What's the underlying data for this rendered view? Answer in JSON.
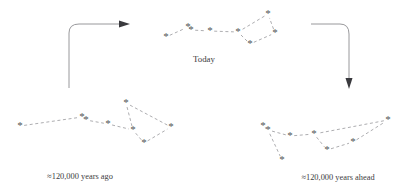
{
  "figure": {
    "background_color": "#ffffff",
    "star_color": "#555558",
    "link_color": "#8a8a8e",
    "arrow_color": "#8c8c90",
    "arrowhead_color": "#3a3a3e",
    "text_color": "#3c3c40",
    "star_glyph": "*"
  },
  "captions": {
    "past": "≈120,000 years ago",
    "present": "Today",
    "future": "≈120,000 years ahead"
  },
  "caption_positions": {
    "past": {
      "x": 80,
      "y": 179
    },
    "present": {
      "x": 204,
      "y": 62
    },
    "future": {
      "x": 338,
      "y": 180
    }
  },
  "chart_data": {
    "type": "scatter",
    "xlabel": "",
    "ylabel": "",
    "grid": false,
    "legend": null,
    "panels": [
      {
        "name": "present",
        "label": "Today",
        "stars": [
          {
            "name": "Alkaid",
            "x": 166,
            "y": 37
          },
          {
            "name": "Mizar",
            "x": 188,
            "y": 27
          },
          {
            "name": "Mizar-B",
            "x": 191,
            "y": 30
          },
          {
            "name": "Alioth",
            "x": 210,
            "y": 31
          },
          {
            "name": "Megrez",
            "x": 238,
            "y": 32
          },
          {
            "name": "Phecda",
            "x": 250,
            "y": 44
          },
          {
            "name": "Merak",
            "x": 275,
            "y": 33
          },
          {
            "name": "Dubhe",
            "x": 268,
            "y": 14
          }
        ],
        "links": [
          [
            0,
            1
          ],
          [
            1,
            2
          ],
          [
            2,
            3
          ],
          [
            3,
            4
          ],
          [
            4,
            5
          ],
          [
            5,
            6
          ],
          [
            6,
            7
          ],
          [
            7,
            4
          ]
        ]
      },
      {
        "name": "past",
        "label": "≈120,000 years ago",
        "stars": [
          {
            "name": "Alkaid",
            "x": 20,
            "y": 126
          },
          {
            "name": "Mizar",
            "x": 82,
            "y": 117
          },
          {
            "name": "Mizar-B",
            "x": 86,
            "y": 120
          },
          {
            "name": "Alioth",
            "x": 108,
            "y": 124
          },
          {
            "name": "Megrez",
            "x": 133,
            "y": 130
          },
          {
            "name": "Phecda",
            "x": 144,
            "y": 143
          },
          {
            "name": "Merak",
            "x": 171,
            "y": 127
          },
          {
            "name": "Dubhe",
            "x": 126,
            "y": 103
          }
        ],
        "links": [
          [
            0,
            1
          ],
          [
            1,
            2
          ],
          [
            2,
            3
          ],
          [
            3,
            4
          ],
          [
            4,
            5
          ],
          [
            5,
            6
          ],
          [
            6,
            7
          ],
          [
            7,
            4
          ]
        ]
      },
      {
        "name": "future",
        "label": "≈120,000 years ahead",
        "stars": [
          {
            "name": "Alkaid",
            "x": 263,
            "y": 126
          },
          {
            "name": "Mizar",
            "x": 268,
            "y": 130
          },
          {
            "name": "Mizar-B",
            "x": 282,
            "y": 160
          },
          {
            "name": "Alioth",
            "x": 290,
            "y": 136
          },
          {
            "name": "Megrez",
            "x": 314,
            "y": 134
          },
          {
            "name": "Phecda",
            "x": 327,
            "y": 150
          },
          {
            "name": "Merak",
            "x": 353,
            "y": 142
          },
          {
            "name": "Dubhe",
            "x": 388,
            "y": 120
          }
        ],
        "links": [
          [
            0,
            1
          ],
          [
            1,
            2
          ],
          [
            1,
            3
          ],
          [
            3,
            4
          ],
          [
            4,
            5
          ],
          [
            5,
            6
          ],
          [
            6,
            7
          ],
          [
            7,
            4
          ]
        ]
      }
    ],
    "arrows": [
      {
        "name": "past-to-present",
        "direction": "right",
        "path": "M 69 88 L 69 33 Q 69 24 79 24 L 119 24",
        "head": "M 119 20.5 L 130 24 L 119 27.5 Z"
      },
      {
        "name": "present-to-future",
        "direction": "down",
        "path": "M 311 24 L 340 24 Q 349 24 349 34 L 349 78",
        "head": "M 345.5 78 L 349 89 L 352.5 78 Z"
      }
    ]
  }
}
